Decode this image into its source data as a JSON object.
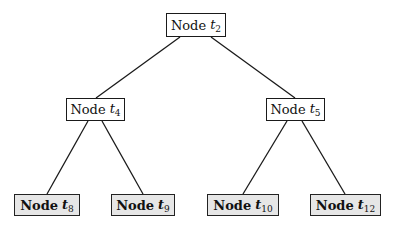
{
  "diagram": {
    "type": "binary-tree",
    "colors": {
      "edge": "#1a1a1a",
      "internal_fill": "#ffffff",
      "leaf_fill": "#e6e6e6",
      "border": "#1a1a1a"
    },
    "nodes": {
      "t2": {
        "prefix": "Node",
        "symbol": "t",
        "subscript": "2",
        "kind": "internal",
        "box": [
          166,
          13,
          60,
          24
        ]
      },
      "t4": {
        "prefix": "Node",
        "symbol": "t",
        "subscript": "4",
        "kind": "internal",
        "box": [
          66,
          98,
          59,
          23
        ]
      },
      "t5": {
        "prefix": "Node",
        "symbol": "t",
        "subscript": "5",
        "kind": "internal",
        "box": [
          266,
          98,
          59,
          23
        ]
      },
      "t8": {
        "prefix": "Node",
        "symbol": "t",
        "subscript": "8",
        "kind": "leaf",
        "box": [
          14,
          194,
          66,
          22
        ]
      },
      "t9": {
        "prefix": "Node",
        "symbol": "t",
        "subscript": "9",
        "kind": "leaf",
        "box": [
          111,
          194,
          64,
          22
        ]
      },
      "t10": {
        "prefix": "Node",
        "symbol": "t",
        "subscript": "10",
        "kind": "leaf",
        "box": [
          207,
          194,
          72,
          22
        ]
      },
      "t12": {
        "prefix": "Node",
        "symbol": "t",
        "subscript": "12",
        "kind": "leaf",
        "box": [
          310,
          194,
          71,
          22
        ]
      }
    },
    "edges": [
      {
        "from": "t2",
        "to": "t4",
        "x1": 180,
        "y1": 37,
        "x2": 96,
        "y2": 98
      },
      {
        "from": "t2",
        "to": "t5",
        "x1": 211,
        "y1": 37,
        "x2": 295,
        "y2": 98
      },
      {
        "from": "t4",
        "to": "t8",
        "x1": 88,
        "y1": 121,
        "x2": 47,
        "y2": 194
      },
      {
        "from": "t4",
        "to": "t9",
        "x1": 102,
        "y1": 121,
        "x2": 143,
        "y2": 194
      },
      {
        "from": "t5",
        "to": "t10",
        "x1": 287,
        "y1": 121,
        "x2": 243,
        "y2": 194
      },
      {
        "from": "t5",
        "to": "t12",
        "x1": 302,
        "y1": 121,
        "x2": 345,
        "y2": 194
      }
    ]
  }
}
